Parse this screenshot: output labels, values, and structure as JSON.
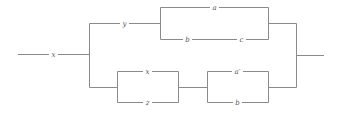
{
  "diagram": {
    "type": "switching-circuit",
    "colors": {
      "wire": "#8a8a8a",
      "label": "#555555",
      "background": "#ffffff"
    },
    "labels": {
      "input_switch": "x",
      "upper_branch_switch": "y",
      "upper_parallel_top": "a",
      "upper_parallel_bottom_1": "b",
      "upper_parallel_bottom_2": "c",
      "lower_box1_top": "x",
      "lower_box1_bottom": "z",
      "lower_box2_top": "a′",
      "lower_box2_bottom": "b"
    }
  }
}
